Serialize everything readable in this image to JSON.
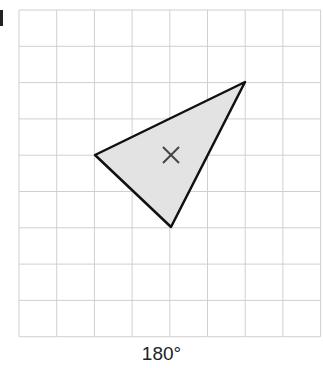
{
  "diagram": {
    "grid": {
      "x0": 19,
      "y0": 10,
      "cell_w": 37.7,
      "cell_h": 36.3,
      "cols": 8,
      "rows": 9,
      "line_color": "#d0d0d0"
    },
    "triangle": {
      "points": [
        [
          95,
          155
        ],
        [
          245,
          82
        ],
        [
          171,
          227
        ]
      ],
      "fill": "#e3e3e3",
      "stroke": "#111111"
    },
    "center_mark": {
      "x": 171,
      "y": 155,
      "symbol": "×"
    },
    "rotation_label": "180°"
  }
}
